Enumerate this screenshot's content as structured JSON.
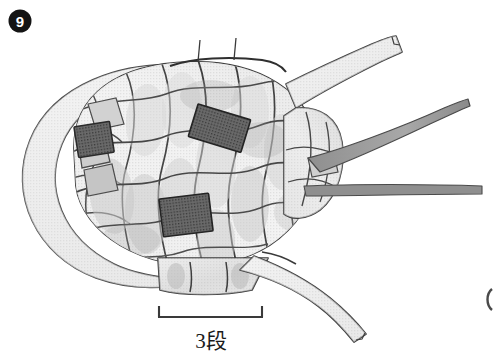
{
  "figure": {
    "number_label": "9",
    "caption_absent": "",
    "background_color": "#ffffff",
    "ink_color": "#3a3a3a"
  },
  "scale_bar": {
    "label": "3段",
    "x_start": 158,
    "x_end": 263,
    "y": 317,
    "tick_height": 11,
    "line_color": "#3a3a3a"
  },
  "palette": {
    "outline": "#4a4a4a",
    "outline_dark": "#2e2e2e",
    "scale_fill_light": "#d5d5d5",
    "scale_fill_mid": "#c0c0c0",
    "scale_fill_dark": "#a8a8a8",
    "patch_dark": "#5e5e5e",
    "patch_darkest": "#4f4f4f",
    "band_fill": "#dcdcdc",
    "appendage_fill": "#d8d8d8",
    "appendage_dark": "#9a9a9a",
    "badge_fill": "#141414"
  },
  "drawing": {
    "title_hidden": "Figure 9 — larval case constructed of overlapping plant scale segments",
    "body": {
      "description": "ovoid scaled case body",
      "center_x": 185,
      "center_y": 170,
      "width": 280,
      "height": 215
    },
    "wrap_band": {
      "description": "broad curved band wrapping the left end of the case"
    },
    "dark_patches": [
      {
        "name": "patch-upper-left",
        "x": 76,
        "y": 124,
        "w": 35,
        "h": 30,
        "rotate": -8
      },
      {
        "name": "patch-upper-right",
        "x": 192,
        "y": 112,
        "w": 54,
        "h": 33,
        "rotate": 17
      },
      {
        "name": "patch-lower-mid",
        "x": 161,
        "y": 196,
        "w": 49,
        "h": 38,
        "rotate": -7
      }
    ],
    "appendages": [
      {
        "name": "appendage-upper-right",
        "type": "broad-strap",
        "direction": "up-right"
      },
      {
        "name": "appendage-mid-right",
        "type": "tapered-blade",
        "direction": "right-up"
      },
      {
        "name": "appendage-lower-right",
        "type": "thin-rod",
        "direction": "right"
      },
      {
        "name": "appendage-bottom",
        "type": "broad-strap",
        "direction": "down-right"
      }
    ],
    "edge_mark": {
      "name": "adjacent-figure-edge",
      "x": 487,
      "y": 298
    }
  }
}
